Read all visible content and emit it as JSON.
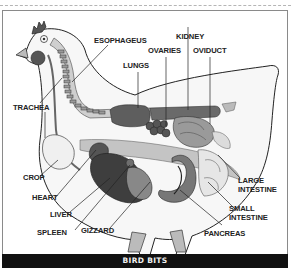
{
  "diagram": {
    "caption": "BIRD BITS",
    "labels": {
      "esophageus": "ESOPHAGEUS",
      "kidney": "KIDNEY",
      "ovaries": "OVARIES",
      "oviduct": "OVIDUCT",
      "lungs": "LUNGS",
      "trachea": "TRACHEA",
      "crop": "CROP",
      "heart": "HEART",
      "liver": "LIVER",
      "spleen": "SPLEEN",
      "gizzard": "GIZZARD",
      "large_intestine_1": "LARGE",
      "large_intestine_2": "INTESTINE",
      "small_intestine_1": "SMALL",
      "small_intestine_2": "INTESTINE",
      "pancreas": "PANCREAS"
    },
    "colors": {
      "outline": "#222222",
      "comb": "#555555",
      "organ_dark": "#4a4a4a",
      "organ_mid": "#7d7d7d",
      "organ_light": "#a8a8a8",
      "tissue_light": "#cfcfcf",
      "caption_bg": "#111111",
      "caption_text": "#f2f2f2"
    }
  }
}
